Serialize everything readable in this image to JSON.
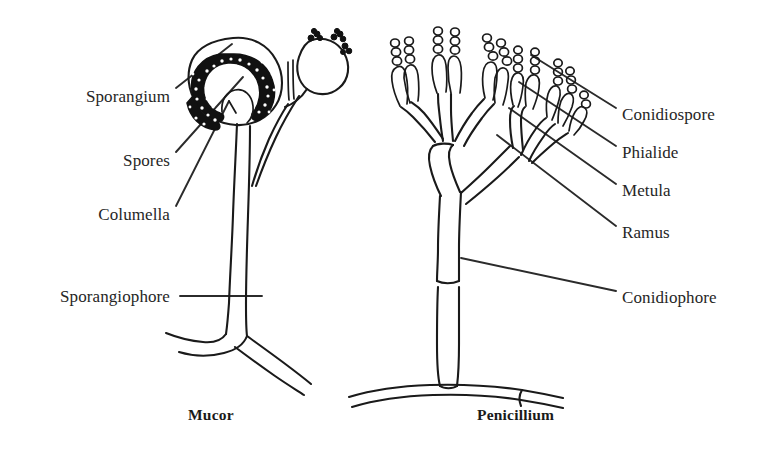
{
  "figure": {
    "kind": "scientific-line-diagram",
    "background_color": "#ffffff",
    "ink_color": "#1a1a1a"
  },
  "panels": [
    {
      "id": "mucor",
      "caption": "Mucor",
      "caption_x": 188,
      "caption_y": 406
    },
    {
      "id": "penicillium",
      "caption": "Penicillium",
      "caption_x": 477,
      "caption_y": 406
    }
  ],
  "labels_left": [
    {
      "id": "sporangium",
      "text": "Sporangium",
      "x": 40,
      "y": 96,
      "width": 130
    },
    {
      "id": "spores",
      "text": "Spores",
      "x": 40,
      "y": 160,
      "width": 130
    },
    {
      "id": "columella",
      "text": "Columella",
      "x": 40,
      "y": 214,
      "width": 130
    },
    {
      "id": "sporangiophore",
      "text": "Sporangiophore",
      "x": 16,
      "y": 288,
      "width": 154
    }
  ],
  "labels_right": [
    {
      "id": "conidiospore",
      "text": "Conidiospore",
      "x": 622,
      "y": 114
    },
    {
      "id": "phialide",
      "text": "Phialide",
      "x": 622,
      "y": 152
    },
    {
      "id": "metula",
      "text": "Metula",
      "x": 622,
      "y": 190
    },
    {
      "id": "ramus",
      "text": "Ramus",
      "x": 622,
      "y": 232
    },
    {
      "id": "conidiophore",
      "text": "Conidiophore",
      "x": 622,
      "y": 297
    }
  ],
  "structures": {
    "mucor": [
      "sporangium-wall",
      "spore-mass",
      "columella",
      "sporangiophore",
      "young-sporangium",
      "basal-hypha"
    ],
    "penicillium": [
      "conidiospore-chains",
      "phialides",
      "metulae",
      "rami",
      "conidiophore-stalk",
      "septa",
      "basal-hypha"
    ]
  }
}
